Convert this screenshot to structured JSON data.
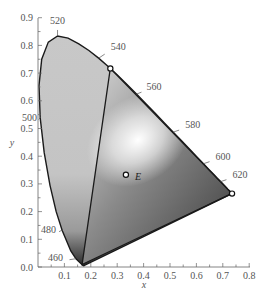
{
  "chart_data": {
    "type": "scatter",
    "title": "",
    "subtitle": "CIE 1931 xy chromaticity diagram with RGB primaries gamut",
    "xlabel": "x",
    "ylabel": "y",
    "xlim": [
      0.0,
      0.8
    ],
    "ylim": [
      0.0,
      0.9
    ],
    "grid": false,
    "x_ticks": [
      "0.1",
      "0.2",
      "0.3",
      "0.4",
      "0.5",
      "0.6",
      "0.7",
      "0.8"
    ],
    "y_ticks": [
      "0.0",
      "0.1",
      "0.2",
      "0.3",
      "0.4",
      "0.5",
      "0.6",
      "0.7",
      "0.8",
      "0.9"
    ],
    "wavelength_labels": [
      {
        "label": "460",
        "x": 0.144,
        "y": 0.03
      },
      {
        "label": "480",
        "x": 0.091,
        "y": 0.133
      },
      {
        "label": "500",
        "x": 0.008,
        "y": 0.538
      },
      {
        "label": "520",
        "x": 0.074,
        "y": 0.834
      },
      {
        "label": "540",
        "x": 0.23,
        "y": 0.754
      },
      {
        "label": "560",
        "x": 0.373,
        "y": 0.624
      },
      {
        "label": "580",
        "x": 0.512,
        "y": 0.487
      },
      {
        "label": "600",
        "x": 0.627,
        "y": 0.373
      },
      {
        "label": "620",
        "x": 0.691,
        "y": 0.308
      }
    ],
    "primaries": [
      {
        "name": "R",
        "x": 0.735,
        "y": 0.265
      },
      {
        "name": "G",
        "x": 0.274,
        "y": 0.717
      },
      {
        "name": "B",
        "x": 0.167,
        "y": 0.009
      }
    ],
    "points": [
      {
        "label": "E",
        "x": 0.333,
        "y": 0.333
      }
    ],
    "spectral_locus": [
      [
        0.1741,
        0.005
      ],
      [
        0.1738,
        0.0049
      ],
      [
        0.1736,
        0.0049
      ],
      [
        0.1733,
        0.0048
      ],
      [
        0.1726,
        0.0048
      ],
      [
        0.1714,
        0.0051
      ],
      [
        0.1689,
        0.0069
      ],
      [
        0.1644,
        0.0109
      ],
      [
        0.1566,
        0.0177
      ],
      [
        0.144,
        0.0297
      ],
      [
        0.1241,
        0.0578
      ],
      [
        0.0913,
        0.1327
      ],
      [
        0.0687,
        0.2007
      ],
      [
        0.0454,
        0.295
      ],
      [
        0.0235,
        0.4127
      ],
      [
        0.0082,
        0.5384
      ],
      [
        0.0039,
        0.6548
      ],
      [
        0.0139,
        0.7502
      ],
      [
        0.0389,
        0.812
      ],
      [
        0.0743,
        0.8338
      ],
      [
        0.1142,
        0.8262
      ],
      [
        0.1547,
        0.8059
      ],
      [
        0.1929,
        0.7816
      ],
      [
        0.2296,
        0.7543
      ],
      [
        0.2658,
        0.7243
      ],
      [
        0.3016,
        0.6923
      ],
      [
        0.3373,
        0.6589
      ],
      [
        0.3731,
        0.6245
      ],
      [
        0.4087,
        0.5896
      ],
      [
        0.4441,
        0.5547
      ],
      [
        0.4788,
        0.5202
      ],
      [
        0.5125,
        0.4866
      ],
      [
        0.5448,
        0.4544
      ],
      [
        0.5752,
        0.4242
      ],
      [
        0.6029,
        0.3965
      ],
      [
        0.627,
        0.3725
      ],
      [
        0.6482,
        0.3514
      ],
      [
        0.6658,
        0.334
      ],
      [
        0.6801,
        0.3197
      ],
      [
        0.6915,
        0.3083
      ],
      [
        0.7006,
        0.2993
      ],
      [
        0.7079,
        0.292
      ],
      [
        0.714,
        0.2859
      ],
      [
        0.719,
        0.2809
      ],
      [
        0.723,
        0.277
      ],
      [
        0.726,
        0.274
      ],
      [
        0.7283,
        0.2717
      ],
      [
        0.73,
        0.27
      ],
      [
        0.7311,
        0.2689
      ],
      [
        0.732,
        0.268
      ],
      [
        0.7327,
        0.2673
      ],
      [
        0.7334,
        0.2666
      ],
      [
        0.734,
        0.266
      ],
      [
        0.7344,
        0.2656
      ],
      [
        0.7346,
        0.2654
      ],
      [
        0.7347,
        0.2653
      ]
    ]
  }
}
